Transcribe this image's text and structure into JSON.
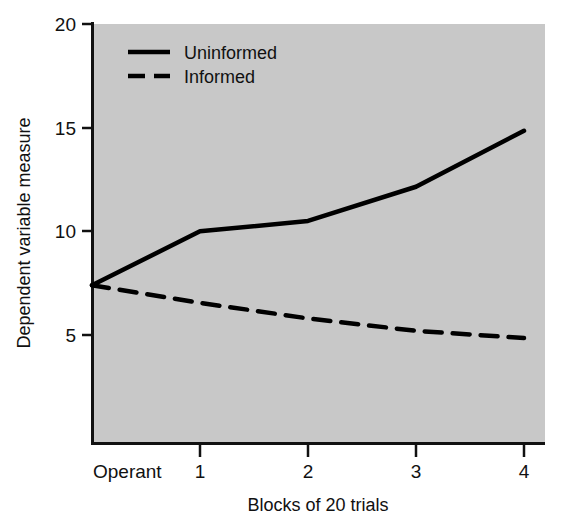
{
  "chart_data": {
    "type": "line",
    "title": "",
    "subtitle": "",
    "xlabel": "Blocks of 20 trials",
    "ylabel": "Dependent variable measure",
    "x": [
      0,
      1,
      2,
      3,
      4
    ],
    "x_tick_labels": [
      "Operant",
      "1",
      "2",
      "3",
      "4"
    ],
    "y_tick_labels": [
      "5",
      "10",
      "15",
      "20"
    ],
    "y_ticks": [
      5,
      10,
      15,
      20
    ],
    "ylim": [
      0,
      20
    ],
    "xlim": [
      0,
      4
    ],
    "grid": false,
    "legend_position": "top-left",
    "plot_background_color": "#c8c8c8",
    "line_color": "#000000",
    "series": [
      {
        "name": "Uninformed",
        "style": "solid",
        "values": [
          7.4,
          10.0,
          10.5,
          12.15,
          14.85
        ]
      },
      {
        "name": "Informed",
        "style": "dashed",
        "values": [
          7.4,
          6.55,
          5.8,
          5.2,
          4.85
        ]
      }
    ],
    "annotations": []
  },
  "axes": {
    "y_tick_labels": [
      "20",
      "15",
      "10",
      "5"
    ],
    "x_tick_labels": [
      "Operant",
      "1",
      "2",
      "3",
      "4"
    ],
    "y_axis_title": "Dependent variable measure",
    "x_axis_title": "Blocks of 20 trials"
  },
  "legend": {
    "entries": [
      {
        "label": "Uninformed",
        "style": "solid"
      },
      {
        "label": "Informed",
        "style": "dashed"
      }
    ]
  }
}
